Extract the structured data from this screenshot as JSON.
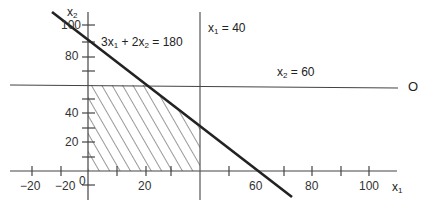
{
  "diagram": {
    "type": "linear-programming-feasible-region",
    "axes": {
      "x_label": "x1",
      "y_label": "x2",
      "origin_label": "0",
      "x_tick_labels": [
        {
          "value": -20,
          "text": "−20",
          "x": 30,
          "y": 179
        },
        {
          "value": 20,
          "text": "20",
          "x": 137,
          "y": 179
        },
        {
          "value": 60,
          "text": "60",
          "x": 249,
          "y": 179
        },
        {
          "value": 80,
          "text": "80",
          "x": 305,
          "y": 179
        },
        {
          "value": 100,
          "text": "100",
          "x": 356,
          "y": 179
        }
      ],
      "y_tick_labels": [
        {
          "value": -20,
          "text": "−20",
          "x": 55,
          "y": 181
        },
        {
          "value": 20,
          "text": "20",
          "x": 64,
          "y": 137
        },
        {
          "value": 40,
          "text": "40",
          "x": 64,
          "y": 108
        },
        {
          "value": 80,
          "text": "80",
          "x": 64,
          "y": 52
        },
        {
          "value": 100,
          "text": "100",
          "x": 59,
          "y": 20
        }
      ]
    },
    "constraints": [
      {
        "name": "x1-limit",
        "label_main": "x",
        "label_sub": "1",
        "label_rest": " = 40"
      },
      {
        "name": "x2-limit",
        "label_main": "x",
        "label_sub": "2",
        "label_rest": " = 60"
      },
      {
        "name": "combined",
        "label_parts": [
          "3x",
          "1",
          " + 2x",
          "2",
          " = 180"
        ]
      }
    ],
    "right_marker": "O",
    "feasible_region": "hatched polygon (0,0)-(40,0)-(40,30)-(20,60)-(0,60)"
  }
}
